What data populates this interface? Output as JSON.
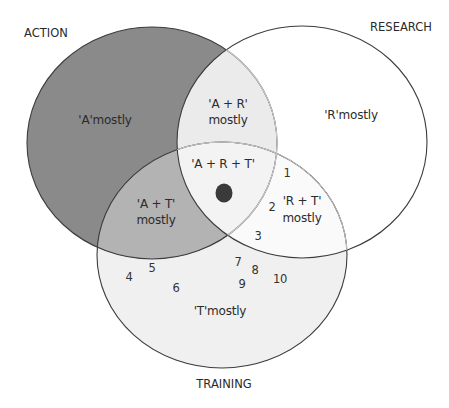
{
  "sets": {
    "action": {
      "title": "ACTION",
      "fill": "#8a8a8a"
    },
    "research": {
      "title": "RESEARCH",
      "fill": "#ffffff"
    },
    "training": {
      "title": "TRAINING",
      "fill": "#f0f0f0"
    }
  },
  "regions": {
    "a_only": "'A'mostly",
    "r_only": "'R'mostly",
    "t_only": "'T'mostly",
    "ar_line1": "'A + R'",
    "ar_line2": "mostly",
    "at_line1": "'A + T'",
    "at_line2": "mostly",
    "rt_line1": "'R + T'",
    "rt_line2": "mostly",
    "art": "'A + R + T'"
  },
  "colors": {
    "ar_overlap": "#ebebeb",
    "at_overlap": "#b3b3b3",
    "art_overlap": "#f3f3f3",
    "rt_overlap": "#fafafa",
    "stroke": "#3c3c3c",
    "marker": "#3a3a3a"
  },
  "marker": {
    "label": "position marker"
  },
  "numbers": [
    {
      "value": "1"
    },
    {
      "value": "2"
    },
    {
      "value": "3"
    },
    {
      "value": "4"
    },
    {
      "value": "5"
    },
    {
      "value": "6"
    },
    {
      "value": "7"
    },
    {
      "value": "8"
    },
    {
      "value": "9"
    },
    {
      "value": "10"
    }
  ]
}
